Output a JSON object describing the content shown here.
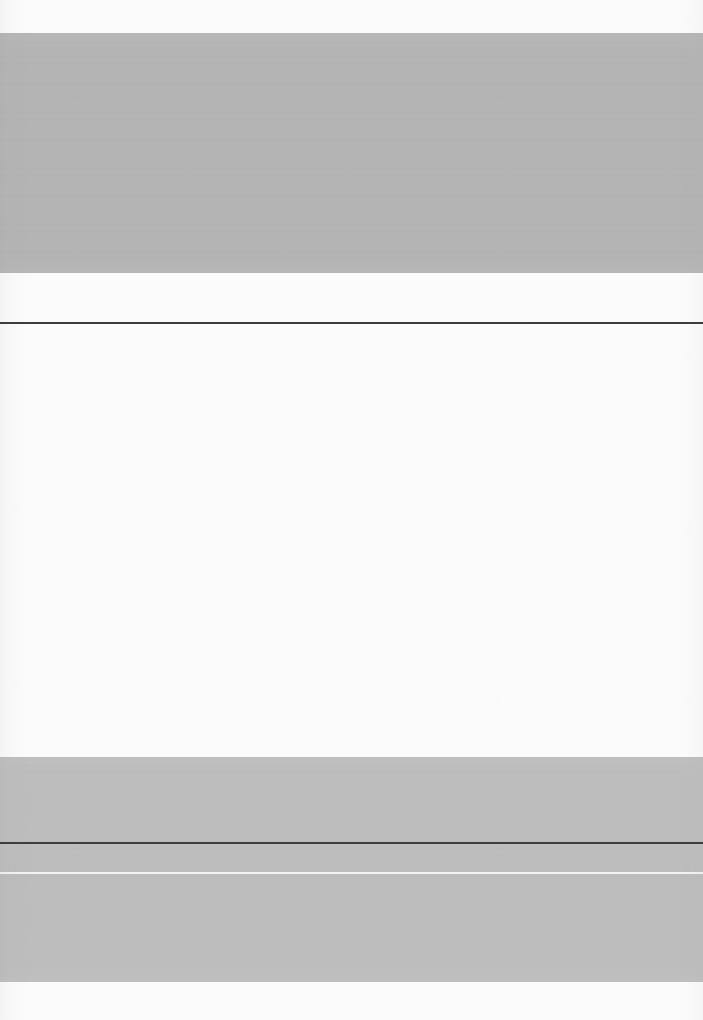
{
  "document": {
    "kind": "scanned-page",
    "page_width": 703,
    "page_height": 1020,
    "visible_text": "",
    "note": ""
  },
  "palette": {
    "paper": "#fbfbfb",
    "band_upper": "#b3b3b3",
    "band_lower": "#bcbcbc",
    "rule_dark": "#3a3e42",
    "rule_light": "#f2f3f4"
  },
  "regions": [
    {
      "id": "top-margin",
      "label": "",
      "role": "paper-margin",
      "top": 0,
      "height": 33,
      "color": "#fbfbfb"
    },
    {
      "id": "upper-band",
      "label": "",
      "role": "gray-band",
      "top": 33,
      "height": 240,
      "color": "#b3b3b3"
    },
    {
      "id": "upper-gap",
      "label": "",
      "role": "paper-gap",
      "top": 273,
      "height": 49,
      "color": "#fbfbfb"
    },
    {
      "id": "header-rule",
      "label": "",
      "role": "horizontal-rule-dark",
      "top": 322,
      "height": 2,
      "color": "#3a3e42"
    },
    {
      "id": "body-area",
      "label": "",
      "role": "paper-body",
      "top": 324,
      "height": 433,
      "color": "#fbfbfb"
    },
    {
      "id": "lower-band",
      "label": "",
      "role": "gray-band",
      "top": 757,
      "height": 225,
      "color": "#bcbcbc"
    },
    {
      "id": "footer-rule-dark",
      "label": "",
      "role": "horizontal-rule-dark",
      "top": 842,
      "height": 2,
      "color": "#3a3e42"
    },
    {
      "id": "footer-rule-light",
      "label": "",
      "role": "horizontal-rule-light",
      "top": 872,
      "height": 2,
      "color": "#f2f3f4"
    },
    {
      "id": "bottom-margin",
      "label": "",
      "role": "paper-margin",
      "top": 982,
      "height": 38,
      "color": "#fbfbfb"
    }
  ]
}
